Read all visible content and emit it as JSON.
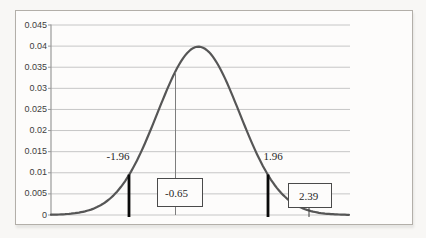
{
  "chart_data": {
    "type": "line",
    "title": "",
    "xlabel": "",
    "ylabel": "",
    "curve": {
      "name": "normal-pdf",
      "mean": 0,
      "peak_density": 0.04
    },
    "ylim": [
      0,
      0.045
    ],
    "y_tick_step": 0.005,
    "y_tick_labels": [
      "0.045",
      "0.04",
      "0.035",
      "0.03",
      "0.025",
      "0.02",
      "0.015",
      "0.01",
      "0.005",
      "0"
    ],
    "x_tick_labels": [],
    "grid": true,
    "legend": false,
    "markers": [
      {
        "value": -1.96,
        "label": "-1.96",
        "style": "bold-vertical-line",
        "density_at_marker": 0.0095
      },
      {
        "value": -0.65,
        "label": "-0.65",
        "style": "thin-vertical-line-with-boxed-label",
        "density_at_marker": 0.035
      },
      {
        "value": 1.96,
        "label": "1.96",
        "style": "bold-vertical-line",
        "density_at_marker": 0.0095
      },
      {
        "value": 2.39,
        "label": "2.39",
        "style": "boxed-label-with-tick",
        "density_at_marker": 0.001
      }
    ]
  },
  "colors": {
    "curve": "#565656",
    "bold_marker_line": "#0a0a0a",
    "thin_marker_line": "#7d7d7d",
    "tick_marker_line": "#3a3a3a",
    "gridline": "#c6c6c6",
    "axis_line": "#9a9a9a",
    "box_border": "#4a4a4a",
    "frame_border": "#b3afa9",
    "text": "#3d3d3d"
  }
}
